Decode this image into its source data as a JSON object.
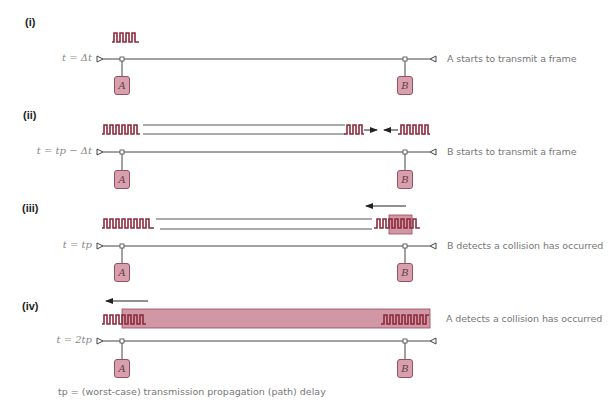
{
  "diagram": {
    "colors": {
      "signal": "#8b2a3c",
      "collision_fill": "#c98595",
      "node_fill": "#d7a0ae",
      "node_border": "#9a4e5e",
      "line": "#444444",
      "text": "#777777"
    },
    "nodes": {
      "a": "A",
      "b": "B"
    },
    "steps": [
      {
        "label": "(i)",
        "time": "t = Δt",
        "description": "A starts to transmit a frame"
      },
      {
        "label": "(ii)",
        "time": "t = tp − Δt",
        "description": "B starts to transmit a frame"
      },
      {
        "label": "(iii)",
        "time": "t = tp",
        "description": "B detects a collision has occurred"
      },
      {
        "label": "(iv)",
        "time": "t = 2tp",
        "description": "A detects a collision has occurred"
      }
    ],
    "footnote": "tp = (worst-case) transmission propagation (path) delay"
  }
}
